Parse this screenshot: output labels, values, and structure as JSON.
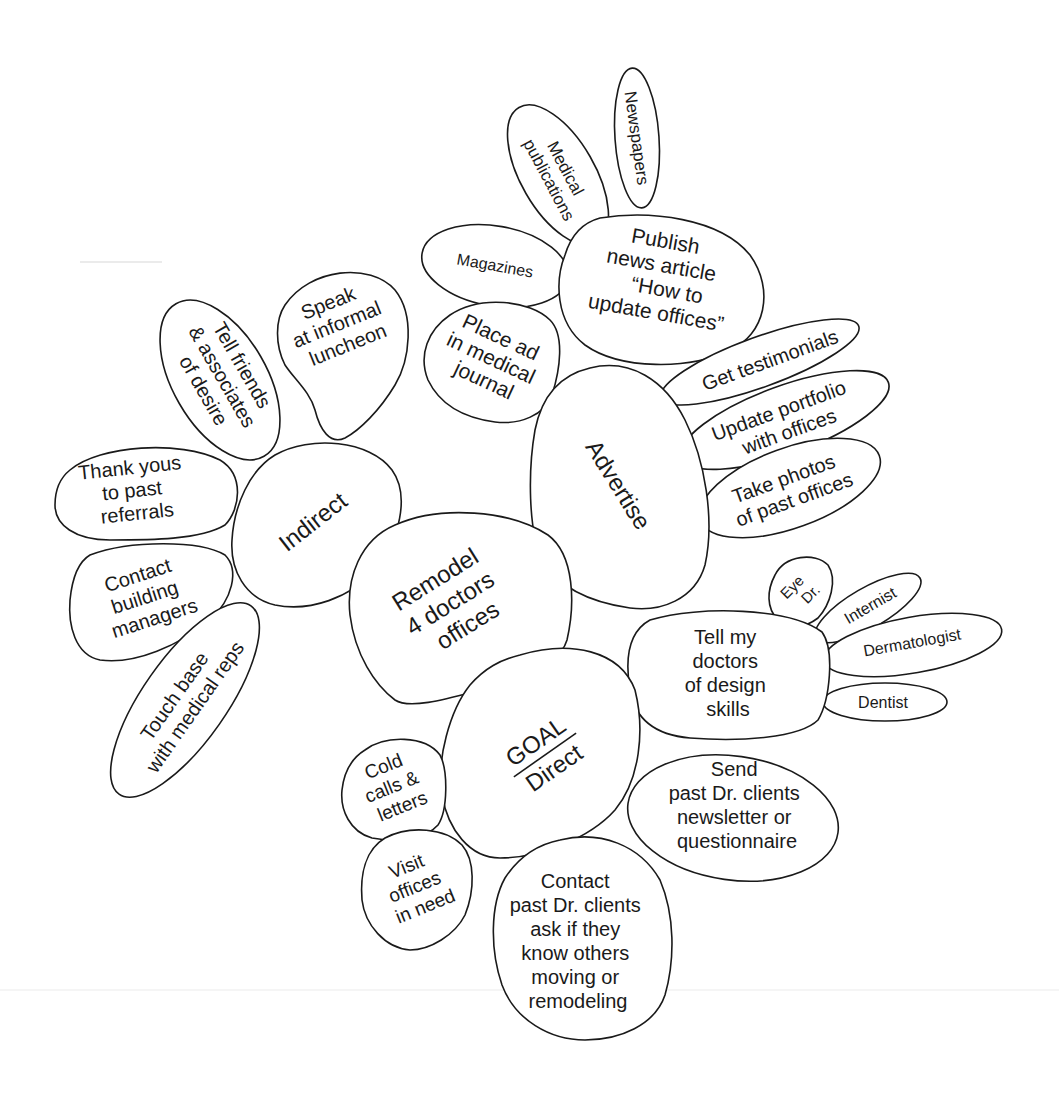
{
  "diagram": {
    "type": "mind-map / bubble diagram",
    "colors": {
      "stroke": "#1a1a1a",
      "fill": "#ffffff",
      "background": "#ffffff"
    },
    "goal": {
      "lines": [
        "Remodel",
        "4 doctors",
        "offices"
      ]
    },
    "branches": {
      "indirect": {
        "label": "Indirect",
        "children": {
          "speak": [
            "Speak",
            "at informal",
            "luncheon"
          ],
          "tell_friends": [
            "Tell friends",
            "& associates",
            "of desire"
          ],
          "thank_yous": [
            "Thank yous",
            "to past",
            "referrals"
          ],
          "contact_managers": [
            "Contact",
            "building",
            "managers"
          ],
          "touch_base": [
            "Touch base",
            "with medical reps"
          ]
        }
      },
      "advertise": {
        "label": "Advertise",
        "children": {
          "publish": {
            "lines": [
              "Publish",
              "news article",
              "“How to",
              "update offices”"
            ],
            "children": {
              "medical_publications": [
                "Medical",
                "publications"
              ],
              "newspapers": [
                "Newspapers"
              ],
              "magazines": [
                "Magazines"
              ]
            }
          },
          "place_ad": [
            "Place ad",
            "in medical",
            "journal"
          ],
          "testimonials": [
            "Get testimonials"
          ],
          "portfolio": [
            "Update portfolio",
            "with offices"
          ],
          "photos": [
            "Take photos",
            "of past offices"
          ]
        }
      },
      "direct": {
        "label_top": "GOAL",
        "label_bottom": "Direct",
        "children": {
          "tell_doctors": {
            "lines": [
              "Tell my",
              "doctors",
              "of design",
              "skills"
            ],
            "children": {
              "eye_dr": [
                "Eye",
                "Dr."
              ],
              "internist": [
                "Internist"
              ],
              "dermatologist": [
                "Dermatologist"
              ],
              "dentist": [
                "Dentist"
              ]
            }
          },
          "send_newsletter": [
            "Send",
            "past Dr. clients",
            "newsletter or",
            "questionnaire"
          ],
          "contact_clients": [
            "Contact",
            "past Dr. clients",
            "ask if they",
            "know others",
            "moving or",
            "remodeling"
          ],
          "cold_calls": [
            "Cold",
            "calls &",
            "letters"
          ],
          "visit_offices": [
            "Visit",
            "offices",
            "in need"
          ]
        }
      }
    }
  }
}
